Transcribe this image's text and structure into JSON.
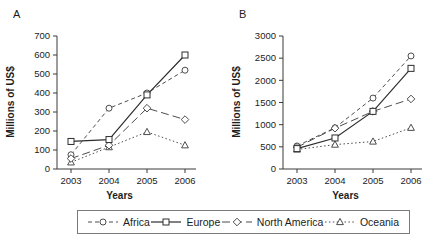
{
  "figure": {
    "ylabel": "Millions of US$",
    "xlabel": "Years"
  },
  "legend": {
    "items": [
      {
        "name": "Africa",
        "marker": "circle",
        "line": "dashed"
      },
      {
        "name": "Europe",
        "marker": "square",
        "line": "solid"
      },
      {
        "name": "North America",
        "marker": "diamond",
        "line": "longdash"
      },
      {
        "name": "Oceania",
        "marker": "triangle",
        "line": "dotted"
      }
    ]
  },
  "colors": {
    "line": "#4d4d4d",
    "solid_line": "#2e2e2e",
    "marker_fill": "#ffffff",
    "text": "#1c1c1c",
    "axis": "#3a3a3a",
    "legend_border": "#7a7a7a"
  },
  "chart_data": [
    {
      "type": "line",
      "panel_label": "A",
      "title": "",
      "xlabel": "Years",
      "ylabel": "Millions of US$",
      "x": [
        "2003",
        "2004",
        "2005",
        "2006"
      ],
      "ylim": [
        0,
        700
      ],
      "ytick_step": 100,
      "grid": false,
      "legend_position": "bottom-shared",
      "series": [
        {
          "name": "Africa",
          "marker": "circle",
          "line": "dashed",
          "values": [
            75,
            320,
            400,
            520
          ]
        },
        {
          "name": "Europe",
          "marker": "square",
          "line": "solid",
          "values": [
            145,
            155,
            390,
            600
          ]
        },
        {
          "name": "North America",
          "marker": "diamond",
          "line": "longdash",
          "values": [
            55,
            125,
            320,
            260
          ]
        },
        {
          "name": "Oceania",
          "marker": "triangle",
          "line": "dotted",
          "values": [
            35,
            115,
            195,
            125
          ]
        }
      ]
    },
    {
      "type": "line",
      "panel_label": "B",
      "title": "",
      "xlabel": "Years",
      "ylabel": "Millions of US$",
      "x": [
        "2003",
        "2004",
        "2005",
        "2006"
      ],
      "ylim": [
        0,
        3000
      ],
      "ytick_step": 500,
      "grid": false,
      "legend_position": "bottom-shared",
      "series": [
        {
          "name": "Africa",
          "marker": "circle",
          "line": "dashed",
          "values": [
            520,
            930,
            1600,
            2550
          ]
        },
        {
          "name": "Europe",
          "marker": "square",
          "line": "solid",
          "values": [
            460,
            700,
            1300,
            2270
          ]
        },
        {
          "name": "North America",
          "marker": "diamond",
          "line": "longdash",
          "values": [
            490,
            920,
            1300,
            1580
          ]
        },
        {
          "name": "Oceania",
          "marker": "triangle",
          "line": "dotted",
          "values": [
            440,
            550,
            620,
            930
          ]
        }
      ]
    }
  ]
}
